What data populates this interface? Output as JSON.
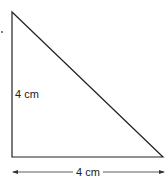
{
  "figure": {
    "type": "right-triangle",
    "vertical_side_label": "4 cm",
    "horizontal_side_label": "4 cm",
    "stroke_color": "#222222",
    "background_color": "#ffffff"
  }
}
